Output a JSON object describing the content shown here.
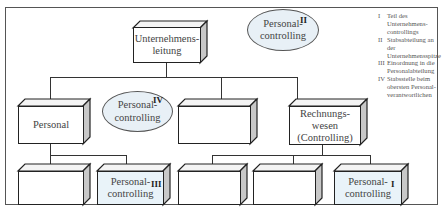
{
  "diagram": {
    "colors": {
      "box_fill": "#ffffff",
      "highlight_fill": "#e9f3f9",
      "ellipse_fill": "#e8f0f6",
      "line": "#333333",
      "side_face": "#c8c8c8",
      "top_face": "#f4f4f4"
    },
    "nodes": {
      "top": {
        "label_line1": "Unternehmens-",
        "label_line2": "leitung"
      },
      "ellipse_ii": {
        "label_line1": "Personal-",
        "label_line2": "controlling",
        "marker": "II"
      },
      "personal": {
        "label": "Personal"
      },
      "ellipse_iv": {
        "label_line1": "Personal-",
        "label_line2": "controlling",
        "marker": "IV"
      },
      "middle_blank": {
        "label": ""
      },
      "rechnungswesen": {
        "label_line1": "Rechnungs-",
        "label_line2": "wesen",
        "label_line3": "(Controlling)"
      },
      "bottom_blank_1": {
        "label": ""
      },
      "bottom_pc_iii": {
        "label_line1": "Personal-",
        "label_line2": "controlling",
        "marker": "III"
      },
      "bottom_blank_2": {
        "label": ""
      },
      "bottom_blank_3": {
        "label": ""
      },
      "bottom_pc_i": {
        "label_line1": "Personal-",
        "label_line2": "controlling",
        "marker": "I"
      }
    },
    "legend": [
      {
        "num": "I",
        "text": "Teil des Unternehmens-controllings"
      },
      {
        "num": "II",
        "text": "Stabsabteilung an der Unternehmensspitze"
      },
      {
        "num": "III",
        "text": "Einordnung in die Personalabteilung"
      },
      {
        "num": "IV",
        "text": "Stabsstelle beim obersten Personal-verantwortlichen"
      }
    ]
  }
}
